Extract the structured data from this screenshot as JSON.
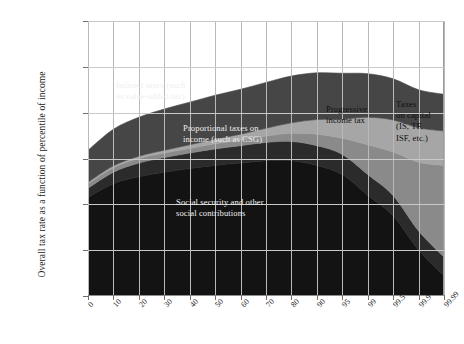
{
  "figure": {
    "y_axis_title": "Overall tax rate as a function\nof percentile of income"
  },
  "chart_data": {
    "type": "area",
    "title": "",
    "subtitle": "",
    "xlabel": "",
    "ylabel": "Overall tax rate as a function of percentile of income",
    "stacked": true,
    "grid": true,
    "legend_position": "inline-annotations",
    "ylim": [
      0,
      60
    ],
    "ytick_labels": [
      "0%",
      "10%",
      "20%",
      "30%",
      "40%",
      "50%",
      "60%"
    ],
    "ytick_values": [
      0,
      10,
      20,
      30,
      40,
      50,
      60
    ],
    "categories": [
      "0",
      "10",
      "20",
      "30",
      "40",
      "50",
      "60",
      "70",
      "80",
      "90",
      "95",
      "99",
      "99.5",
      "99.9",
      "99.99"
    ],
    "series": [
      {
        "name": "Social security and other social contributions",
        "color": "#131313",
        "label_text": "Social security and other\nsocial contributions",
        "values": [
          21.5,
          24.5,
          26.0,
          27.0,
          27.8,
          28.5,
          29.0,
          29.5,
          29.5,
          28.5,
          26.5,
          22.0,
          17.5,
          10.0,
          4.5
        ]
      },
      {
        "name": "Proportional taxes on income (such as CSG)",
        "color": "#2b2b2b",
        "label_text": "Proportional taxes on\nincome (such as CSG)",
        "values": [
          2.0,
          2.5,
          3.0,
          3.2,
          3.4,
          3.6,
          3.8,
          4.0,
          4.2,
          4.3,
          4.4,
          4.5,
          4.4,
          4.2,
          4.0
        ]
      },
      {
        "name": "Taxes on capital (IS, TF, ISF, etc.)",
        "color": "#8a8a8a",
        "label_text": "Taxes\non capital\n(IS, TF,\nISF, etc.)",
        "values": [
          1.0,
          1.0,
          1.0,
          1.0,
          1.0,
          1.1,
          1.2,
          1.4,
          1.8,
          2.5,
          3.5,
          6.5,
          9.5,
          15.0,
          20.0
        ]
      },
      {
        "name": "Progressive income tax",
        "color": "#a6a6a6",
        "label_text": "Progressive\nincome tax",
        "values": [
          0.3,
          0.4,
          0.5,
          0.6,
          0.8,
          1.0,
          1.3,
          1.7,
          2.3,
          3.2,
          4.2,
          6.0,
          7.0,
          7.5,
          7.5
        ]
      },
      {
        "name": "Indirect taxes (such as value-added tax)",
        "color": "#464646",
        "label_text": "Indirect taxes (such\nas value-added tax)",
        "values": [
          7.0,
          8.0,
          8.5,
          9.0,
          9.3,
          9.6,
          9.8,
          10.0,
          10.2,
          10.2,
          10.0,
          9.5,
          9.0,
          8.3,
          8.0
        ]
      }
    ],
    "totals": [
      31.8,
      36.4,
      39.0,
      40.8,
      42.3,
      43.8,
      45.1,
      46.6,
      48.0,
      48.7,
      48.6,
      48.5,
      47.4,
      45.0,
      44.0
    ]
  }
}
